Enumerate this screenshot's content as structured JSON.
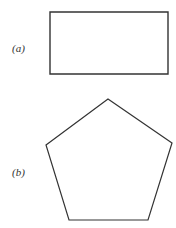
{
  "figures": [
    {
      "label": "(a)",
      "shape": "rectangle",
      "points": [
        [
          50,
          12
        ],
        [
          168,
          12
        ],
        [
          168,
          74
        ],
        [
          50,
          74
        ]
      ]
    },
    {
      "label": "(b)",
      "shape": "pentagon",
      "points": [
        [
          108,
          99
        ],
        [
          172,
          143
        ],
        [
          148,
          220
        ],
        [
          69,
          220
        ],
        [
          46,
          145
        ]
      ]
    }
  ],
  "colors": {
    "stroke": "#333333",
    "background": "#ffffff"
  }
}
